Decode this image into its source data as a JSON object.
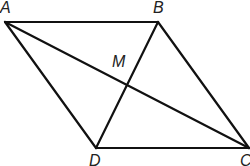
{
  "diagram": {
    "type": "parallelogram-with-diagonals",
    "stroke_color": "#111111",
    "vertices": {
      "A": {
        "label": "A",
        "x": 5,
        "y": 22
      },
      "B": {
        "label": "B",
        "x": 158,
        "y": 22
      },
      "C": {
        "label": "C",
        "x": 249,
        "y": 148
      },
      "D": {
        "label": "D",
        "x": 96,
        "y": 148
      }
    },
    "intersection": {
      "label": "M",
      "x": 127,
      "y": 85
    },
    "labels": {
      "A": "A",
      "B": "B",
      "C": "C",
      "D": "D",
      "M": "M"
    },
    "edges": [
      [
        "A",
        "B"
      ],
      [
        "B",
        "C"
      ],
      [
        "C",
        "D"
      ],
      [
        "D",
        "A"
      ]
    ],
    "diagonals": [
      [
        "A",
        "C"
      ],
      [
        "B",
        "D"
      ]
    ]
  }
}
